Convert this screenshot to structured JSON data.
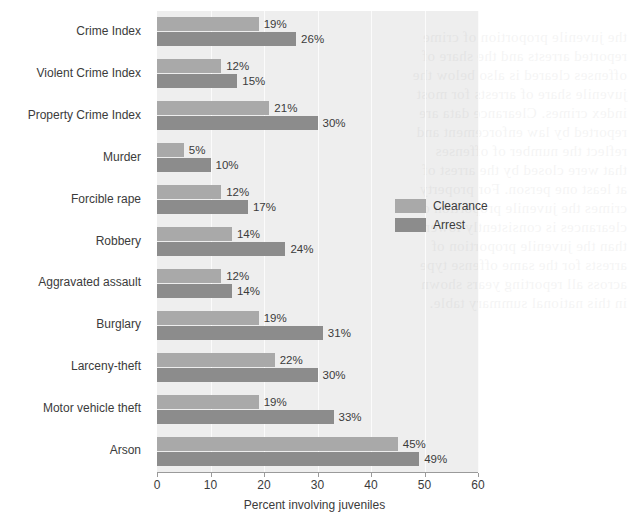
{
  "chart_data": {
    "type": "bar",
    "orientation": "horizontal",
    "title": "",
    "xlabel": "Percent involving juveniles",
    "ylabel": "",
    "xlim": [
      0,
      60
    ],
    "xticks": [
      0,
      10,
      20,
      30,
      40,
      50,
      60
    ],
    "grid": true,
    "grid_axis": "x",
    "legend_position": "center-right",
    "categories": [
      "Crime Index",
      "Violent Crime Index",
      "Property Crime Index",
      "Murder",
      "Forcible rape",
      "Robbery",
      "Aggravated assault",
      "Burglary",
      "Larceny-theft",
      "Motor vehicle theft",
      "Arson"
    ],
    "series": [
      {
        "name": "Clearance",
        "color": "#a9a9a9",
        "values": [
          19,
          12,
          21,
          5,
          12,
          14,
          12,
          19,
          22,
          19,
          45
        ],
        "labels": [
          "19%",
          "12%",
          "21%",
          "5%",
          "12%",
          "14%",
          "12%",
          "19%",
          "22%",
          "19%",
          "45%"
        ]
      },
      {
        "name": "Arrest",
        "color": "#8c8c8c",
        "values": [
          26,
          15,
          30,
          10,
          17,
          24,
          14,
          31,
          30,
          33,
          49
        ],
        "labels": [
          "26%",
          "15%",
          "30%",
          "10%",
          "17%",
          "24%",
          "14%",
          "31%",
          "30%",
          "33%",
          "49%"
        ]
      }
    ]
  },
  "legend": {
    "items": [
      {
        "label": "Clearance",
        "color": "#a9a9a9"
      },
      {
        "label": "Arrest",
        "color": "#8c8c8c"
      }
    ]
  },
  "axis": {
    "x_title": "Percent involving juveniles",
    "tick_labels": [
      "0",
      "10",
      "20",
      "30",
      "40",
      "50",
      "60"
    ]
  },
  "colors": {
    "plot_background": "#eeeeee",
    "page_background": "#ffffff",
    "gridline": "#fbfbfb",
    "axis_line": "#9a9a9a",
    "text": "#3b3b3b",
    "clearance_bar": "#a9a9a9",
    "arrest_bar": "#8c8c8c"
  }
}
